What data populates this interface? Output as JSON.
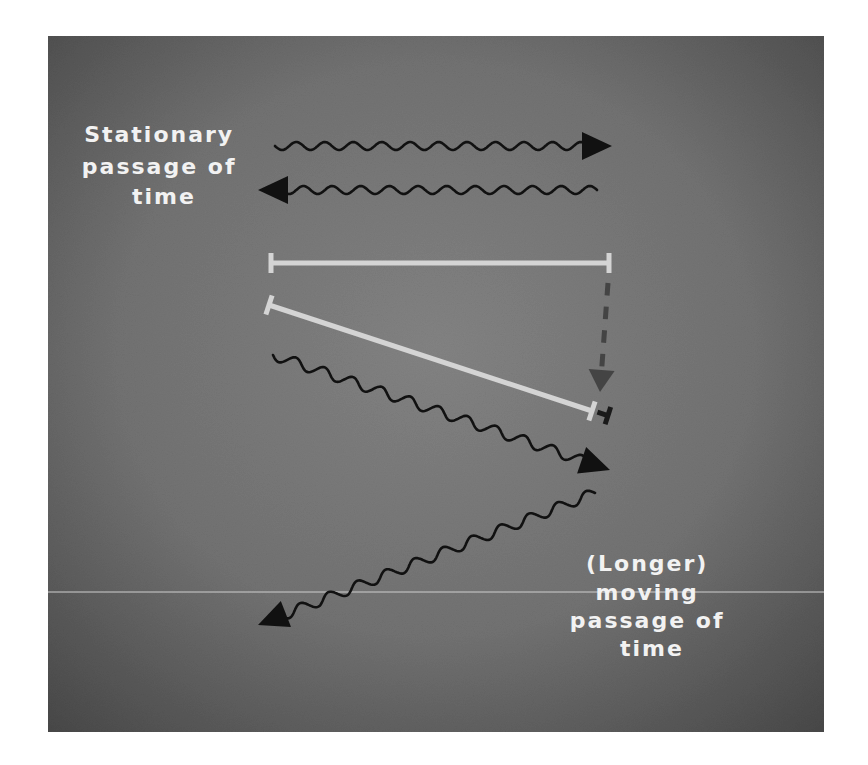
{
  "figure": {
    "panel": {
      "x": 48,
      "y": 36,
      "width": 776,
      "height": 696,
      "center_color": "#838383",
      "edge_color": "#474747"
    },
    "divider_line": {
      "y": 592,
      "color": "#cfcfcf"
    },
    "labels": {
      "stationary": {
        "lines": [
          "Stationary",
          "passage of",
          "time"
        ],
        "center_x": 164,
        "baselines": [
          142,
          174,
          204
        ]
      },
      "moving": {
        "lines": [
          "(Longer)",
          "moving",
          "passage of",
          "time"
        ],
        "center_x": 652,
        "baselines": [
          571,
          600,
          628,
          656
        ]
      }
    },
    "wavy_arrows": [
      {
        "id": "stationary-outgoing",
        "from": [
          275,
          146
        ],
        "to": [
          612,
          146
        ],
        "periods": 11,
        "amplitude": 4,
        "color": "#111111"
      },
      {
        "id": "stationary-return",
        "from": [
          597,
          190
        ],
        "to": [
          258,
          190
        ],
        "periods": 11,
        "amplitude": 4,
        "color": "#111111"
      },
      {
        "id": "moving-outgoing",
        "from": [
          273,
          355
        ],
        "to": [
          610,
          470
        ],
        "periods": 11,
        "amplitude": 5,
        "color": "#111111"
      },
      {
        "id": "moving-return",
        "from": [
          595,
          493
        ],
        "to": [
          258,
          625
        ],
        "periods": 11,
        "amplitude": 5,
        "color": "#111111"
      }
    ],
    "rulers": [
      {
        "id": "stationary-ruler",
        "from": [
          271,
          263
        ],
        "to": [
          609,
          263
        ],
        "color": "#d4d4d4"
      },
      {
        "id": "moving-ruler",
        "from": [
          269,
          305
        ],
        "to": [
          592,
          411
        ],
        "color": "#d4d4d4"
      }
    ],
    "contraction_arrow": {
      "from": [
        608,
        283
      ],
      "to": [
        600,
        392
      ],
      "color": "#444444",
      "dashes": 4
    },
    "difference_marker": {
      "at": [
        606,
        415
      ],
      "color": "#1a1a1a"
    }
  }
}
